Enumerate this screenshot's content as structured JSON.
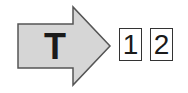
{
  "arrow": {
    "label": "T",
    "fill_color": "#d6d6d6",
    "stroke_color": "#555555",
    "direction": "right"
  },
  "boxes": [
    {
      "label": "1"
    },
    {
      "label": "2"
    }
  ]
}
